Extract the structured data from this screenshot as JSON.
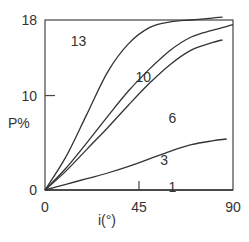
{
  "chart_data": {
    "type": "line",
    "title": "",
    "xlabel": "i(°)",
    "ylabel": "P%",
    "xlim": [
      0,
      90
    ],
    "ylim": [
      0,
      18
    ],
    "xticks": [
      0,
      45,
      90
    ],
    "yticks": [
      0,
      10,
      18
    ],
    "grid": false,
    "legend": "inline curve labels",
    "series": [
      {
        "name": "13",
        "x": [
          0,
          10,
          20,
          30,
          40,
          50,
          60,
          70,
          80,
          85
        ],
        "values": [
          0,
          3.5,
          8,
          12.5,
          15.5,
          17.2,
          17.8,
          18.0,
          18.2,
          18.3
        ]
      },
      {
        "name": "10",
        "x": [
          0,
          10,
          20,
          30,
          40,
          50,
          60,
          70,
          80,
          90
        ],
        "values": [
          0,
          2.3,
          5,
          7.8,
          10.5,
          12.8,
          14.8,
          16.2,
          16.9,
          17.5
        ]
      },
      {
        "name": "6",
        "x": [
          0,
          10,
          20,
          30,
          40,
          50,
          60,
          70,
          80,
          85
        ],
        "values": [
          0,
          2,
          4.3,
          6.6,
          9,
          11.3,
          13.3,
          14.8,
          15.6,
          15.9
        ]
      },
      {
        "name": "3",
        "x": [
          0,
          10,
          20,
          30,
          40,
          50,
          60,
          70,
          80,
          87
        ],
        "values": [
          0,
          0.6,
          1.2,
          1.8,
          2.5,
          3.3,
          4.1,
          4.8,
          5.2,
          5.4
        ]
      },
      {
        "name": "1",
        "x": [
          0,
          90
        ],
        "values": [
          0,
          0
        ]
      }
    ],
    "curve_labels": [
      {
        "text": "13",
        "x": 16,
        "y": 15.3
      },
      {
        "text": "10",
        "x": 47,
        "y": 11.4
      },
      {
        "text": "6",
        "x": 61,
        "y": 7.1
      },
      {
        "text": "3",
        "x": 57,
        "y": 2.6
      },
      {
        "text": "1",
        "x": 61,
        "y": -0.2
      }
    ]
  },
  "axes": {
    "x_label": "i(°)",
    "y_label": "P%",
    "x_ticks": [
      "0",
      "45",
      "90"
    ],
    "y_ticks": [
      "0",
      "10",
      "18"
    ]
  },
  "colors": {
    "line": "#333333",
    "frame": "#444444",
    "background": "#ffffff"
  }
}
